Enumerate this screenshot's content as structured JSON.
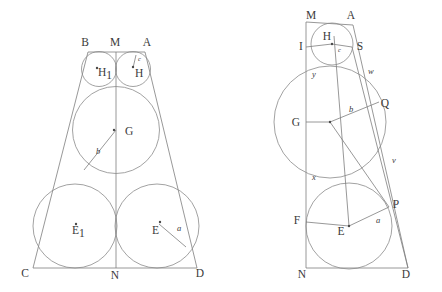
{
  "figure": {
    "background_color": "#ffffff",
    "line_color": "#7e7e7e",
    "label_color": "#3a3a3a"
  },
  "left_figure": {
    "name": "isosceles-trapezoid-with-five-inscribed-circles",
    "vertices": [
      {
        "label": "B",
        "x": 85,
        "y": 46
      },
      {
        "label": "M",
        "x": 115,
        "y": 46
      },
      {
        "label": "A",
        "x": 147,
        "y": 46
      },
      {
        "label": "C",
        "x": 25,
        "y": 277
      },
      {
        "label": "N",
        "x": 115,
        "y": 279
      },
      {
        "label": "D",
        "x": 200,
        "y": 277
      }
    ],
    "outline": {
      "top_left": {
        "x": 88,
        "y": 52
      },
      "top_right": {
        "x": 145,
        "y": 52
      },
      "bot_left": {
        "x": 33,
        "y": 268
      },
      "bot_right": {
        "x": 197,
        "y": 268
      }
    },
    "axis": {
      "x": 116,
      "y_top": 52,
      "y_bottom": 268
    },
    "circles": [
      {
        "name": "circle-H1",
        "cx": 99,
        "cy": 69,
        "r": 17.5,
        "center_label": "H",
        "subscript": "1",
        "label_x": 98,
        "label_y": 76
      },
      {
        "name": "circle-H",
        "cx": 133,
        "cy": 69,
        "r": 17.5,
        "center_label": "H",
        "subscript": "",
        "label_x": 135,
        "label_y": 77
      },
      {
        "name": "circle-G",
        "cx": 116,
        "cy": 130,
        "r": 43.5,
        "center_label": "G",
        "subscript": "",
        "label_x": 125,
        "label_y": 135
      },
      {
        "name": "circle-E1",
        "cx": 75,
        "cy": 226,
        "r": 42,
        "center_label": "E",
        "subscript": "1",
        "label_x": 72,
        "label_y": 234
      },
      {
        "name": "circle-E",
        "cx": 157,
        "cy": 226,
        "r": 42,
        "center_label": "E",
        "subscript": "",
        "label_x": 152,
        "label_y": 234
      }
    ],
    "center_dots": [
      {
        "cx": 97,
        "cy": 68
      },
      {
        "cx": 133,
        "cy": 67
      },
      {
        "cx": 114,
        "cy": 130
      },
      {
        "cx": 76,
        "cy": 224
      },
      {
        "cx": 160,
        "cy": 222
      }
    ],
    "radii": [
      {
        "name": "radius-c",
        "label": "c",
        "x1": 133,
        "y1": 68,
        "x2": 136,
        "y2": 55,
        "label_x": 138,
        "label_y": 61
      },
      {
        "name": "radius-b",
        "label": "b",
        "x1": 116,
        "y1": 130,
        "x2": 84,
        "y2": 170,
        "label_x": 96,
        "label_y": 154
      },
      {
        "name": "radius-a",
        "label": "a",
        "x1": 159,
        "y1": 224,
        "x2": 186,
        "y2": 247,
        "label_x": 177,
        "label_y": 231
      }
    ]
  },
  "right_figure": {
    "name": "right-trapezoid-with-three-inscribed-circles",
    "vertices": [
      {
        "label": "M",
        "x": 311,
        "y": 19
      },
      {
        "label": "A",
        "x": 351,
        "y": 19
      },
      {
        "label": "I",
        "x": 301,
        "y": 50
      },
      {
        "label": "S",
        "x": 356,
        "y": 50
      },
      {
        "label": "G",
        "x": 296,
        "y": 126
      },
      {
        "label": "Q",
        "x": 381,
        "y": 107
      },
      {
        "label": "F",
        "x": 297,
        "y": 224
      },
      {
        "label": "P",
        "x": 393,
        "y": 208
      },
      {
        "label": "E",
        "x": 341,
        "y": 235
      },
      {
        "label": "N",
        "x": 302,
        "y": 278
      },
      {
        "label": "D",
        "x": 406,
        "y": 278
      }
    ],
    "outline": {
      "top_left": {
        "x": 306,
        "y": 22
      },
      "top_right": {
        "x": 353,
        "y": 25
      },
      "bot_left": {
        "x": 306,
        "y": 268
      },
      "bot_right": {
        "x": 408,
        "y": 268
      }
    },
    "left_edge": {
      "x": 306,
      "y_top": 22,
      "y_bottom": 268
    },
    "circles": [
      {
        "name": "circle-H",
        "cx": 332,
        "cy": 44,
        "r": 21,
        "center_label": "H",
        "label_x": 327,
        "label_y": 40
      },
      {
        "name": "circle-G",
        "cx": 330,
        "cy": 122,
        "r": 56,
        "center_label": "G",
        "label_x": 296,
        "label_y": 126
      },
      {
        "name": "circle-E",
        "cx": 349,
        "cy": 226,
        "r": 43,
        "center_label": "E",
        "label_x": 341,
        "label_y": 235
      }
    ],
    "segments": [
      {
        "name": "segment-I-to-H",
        "x1": 306,
        "y1": 47,
        "x2": 332,
        "y2": 44
      },
      {
        "name": "segment-H-to-S",
        "x1": 332,
        "y1": 44,
        "x2": 352,
        "y2": 47
      },
      {
        "name": "segment-G-to-Q",
        "x1": 330,
        "y1": 122,
        "x2": 379,
        "y2": 102
      },
      {
        "name": "segment-F-to-E",
        "x1": 306,
        "y1": 222,
        "x2": 349,
        "y2": 226
      },
      {
        "name": "segment-E-to-P",
        "x1": 349,
        "y1": 226,
        "x2": 389,
        "y2": 207
      },
      {
        "name": "segment-G-to-left",
        "x1": 330,
        "y1": 122,
        "x2": 306,
        "y2": 122
      },
      {
        "name": "chord-H-to-E",
        "x1": 334,
        "y1": 36,
        "x2": 349,
        "y2": 226
      },
      {
        "name": "chord-G-to-P",
        "x1": 330,
        "y1": 122,
        "x2": 389,
        "y2": 207
      },
      {
        "name": "chord-S-to-D",
        "x1": 352,
        "y1": 47,
        "x2": 408,
        "y2": 268
      },
      {
        "name": "chord-A-to-D",
        "x1": 353,
        "y1": 25,
        "x2": 408,
        "y2": 268
      }
    ],
    "labels": [
      {
        "name": "label-c",
        "text": "c",
        "x": 338,
        "y": 52
      },
      {
        "name": "label-y",
        "text": "y",
        "x": 312,
        "y": 77
      },
      {
        "name": "label-w",
        "text": "w",
        "x": 368,
        "y": 74
      },
      {
        "name": "label-b",
        "text": "b",
        "x": 349,
        "y": 112
      },
      {
        "name": "label-x",
        "text": "x",
        "x": 312,
        "y": 180
      },
      {
        "name": "label-v",
        "text": "v",
        "x": 392,
        "y": 163
      },
      {
        "name": "label-a",
        "text": "a",
        "x": 376,
        "y": 223
      }
    ],
    "center_dots": [
      {
        "cx": 332,
        "cy": 44
      },
      {
        "cx": 330,
        "cy": 122
      },
      {
        "cx": 349,
        "cy": 226
      }
    ]
  }
}
